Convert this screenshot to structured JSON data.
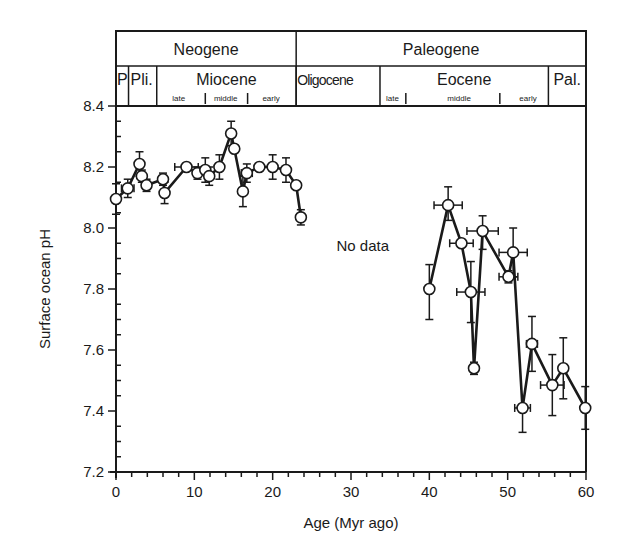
{
  "chart_data": {
    "type": "line",
    "title": "",
    "xlabel": "Age (Myr ago)",
    "ylabel": "Surface ocean pH",
    "xlim": [
      0,
      60
    ],
    "ylim": [
      7.2,
      8.4
    ],
    "x_ticks": [
      0,
      10,
      20,
      30,
      40,
      50,
      60
    ],
    "x_tick_labels": [
      "0",
      "10",
      "20",
      "30",
      "40",
      "50",
      "60"
    ],
    "y_ticks": [
      7.2,
      7.4,
      7.6,
      7.8,
      8.0,
      8.2,
      8.4
    ],
    "y_tick_labels": [
      "7.2",
      "7.4",
      "7.6",
      "7.8",
      "8.0",
      "8.2",
      "8.4"
    ],
    "grid": false,
    "legend": null,
    "annotations": [
      {
        "text": "No data",
        "x": 31.5,
        "y": 7.94
      }
    ],
    "marker": "open-circle",
    "series": [
      {
        "name": "Neogene segment",
        "points": [
          {
            "x": 0.0,
            "y": 8.095,
            "yerr": [
              0.05,
              0.05
            ],
            "xerr": 0
          },
          {
            "x": 1.5,
            "y": 8.13,
            "yerr": [
              0.03,
              0.03
            ],
            "xerr": 0.8
          },
          {
            "x": 3.0,
            "y": 8.21,
            "yerr": [
              0.04,
              0.04
            ],
            "xerr": 0
          },
          {
            "x": 3.3,
            "y": 8.17,
            "yerr": [
              0.02,
              0.02
            ],
            "xerr": 0
          },
          {
            "x": 3.9,
            "y": 8.14,
            "yerr": [
              0.02,
              0.02
            ],
            "xerr": 0
          },
          {
            "x": 6.0,
            "y": 8.16,
            "yerr": [
              0.02,
              0.02
            ],
            "xerr": 0
          },
          {
            "x": 6.2,
            "y": 8.115,
            "yerr": [
              0.035,
              0.035
            ],
            "xerr": 0
          },
          {
            "x": 9.0,
            "y": 8.2,
            "yerr": [
              0.0,
              0.0
            ],
            "xerr": 1.5
          },
          {
            "x": 10.4,
            "y": 8.18,
            "yerr": [
              0.02,
              0.02
            ],
            "xerr": 0
          },
          {
            "x": 11.4,
            "y": 8.19,
            "yerr": [
              0.04,
              0.04
            ],
            "xerr": 0
          },
          {
            "x": 11.9,
            "y": 8.17,
            "yerr": [
              0.03,
              0.03
            ],
            "xerr": 0
          },
          {
            "x": 13.2,
            "y": 8.2,
            "yerr": [
              0.04,
              0.04
            ],
            "xerr": 0
          },
          {
            "x": 14.7,
            "y": 8.31,
            "yerr": [
              0.04,
              0.04
            ],
            "xerr": 0
          },
          {
            "x": 15.1,
            "y": 8.26,
            "yerr": [
              0.0,
              0.0
            ],
            "xerr": 0
          },
          {
            "x": 16.2,
            "y": 8.12,
            "yerr": [
              0.05,
              0.05
            ],
            "xerr": 0
          },
          {
            "x": 16.7,
            "y": 8.18,
            "yerr": [
              0.03,
              0.03
            ],
            "xerr": 0.7
          },
          {
            "x": 18.3,
            "y": 8.2,
            "yerr": [
              0.0,
              0.0
            ],
            "xerr": 0
          },
          {
            "x": 20.0,
            "y": 8.2,
            "yerr": [
              0.04,
              0.04
            ],
            "xerr": 0
          },
          {
            "x": 21.7,
            "y": 8.19,
            "yerr": [
              0.04,
              0.04
            ],
            "xerr": 0
          },
          {
            "x": 23.0,
            "y": 8.14,
            "yerr": [
              0.0,
              0.0
            ],
            "xerr": 0
          },
          {
            "x": 23.6,
            "y": 8.035,
            "yerr": [
              0.025,
              0.025
            ],
            "xerr": 0
          }
        ]
      },
      {
        "name": "Paleogene segment",
        "points": [
          {
            "x": 40.0,
            "y": 7.8,
            "yerr": [
              0.1,
              0.08
            ],
            "xerr": 0
          },
          {
            "x": 42.4,
            "y": 8.075,
            "yerr": [
              0.05,
              0.06
            ],
            "xerr": 1.8
          },
          {
            "x": 44.1,
            "y": 7.95,
            "yerr": [
              0.0,
              0.0
            ],
            "xerr": 1.5
          },
          {
            "x": 45.3,
            "y": 7.79,
            "yerr": [
              0.1,
              0.1
            ],
            "xerr": 1.8
          },
          {
            "x": 45.7,
            "y": 7.54,
            "yerr": [
              0.02,
              0.02
            ],
            "xerr": 0
          },
          {
            "x": 46.8,
            "y": 7.99,
            "yerr": [
              0.06,
              0.05
            ],
            "xerr": 2.0
          },
          {
            "x": 50.1,
            "y": 7.84,
            "yerr": [
              0.02,
              0.02
            ],
            "xerr": 1.2
          },
          {
            "x": 50.7,
            "y": 7.92,
            "yerr": [
              0.08,
              0.08
            ],
            "xerr": 1.8
          },
          {
            "x": 51.9,
            "y": 7.41,
            "yerr": [
              0.08,
              0.0
            ],
            "xerr": 1.0
          },
          {
            "x": 53.1,
            "y": 7.62,
            "yerr": [
              0.09,
              0.09
            ],
            "xerr": 0.7
          },
          {
            "x": 55.7,
            "y": 7.485,
            "yerr": [
              0.1,
              0.1
            ],
            "xerr": 1.5
          },
          {
            "x": 57.1,
            "y": 7.54,
            "yerr": [
              0.1,
              0.1
            ],
            "xerr": 0
          },
          {
            "x": 59.9,
            "y": 7.41,
            "yerr": [
              0.07,
              0.07
            ],
            "xerr": 0
          }
        ]
      }
    ],
    "timescale": {
      "periods": [
        {
          "label": "Neogene",
          "start": 0,
          "end": 23.0
        },
        {
          "label": "Paleogene",
          "start": 23.0,
          "end": 60
        }
      ],
      "epochs": [
        {
          "label": "P",
          "start": 0,
          "end": 1.6
        },
        {
          "label": "Pli.",
          "start": 1.6,
          "end": 5.2
        },
        {
          "label": "Miocene",
          "start": 5.2,
          "end": 23.0,
          "sub": [
            {
              "label": "late",
              "at": 8.0
            },
            {
              "label": "middle",
              "at": 14.0
            },
            {
              "label": "early",
              "at": 19.8
            }
          ],
          "sub_ticks": [
            11.4,
            16.8
          ]
        },
        {
          "label": "Oligocene",
          "start": 23.0,
          "end": 33.7
        },
        {
          "label": "Eocene",
          "start": 33.7,
          "end": 55.2,
          "sub": [
            {
              "label": "late",
              "at": 35.3
            },
            {
              "label": "middle",
              "at": 43.8
            },
            {
              "label": "early",
              "at": 52.6
            }
          ],
          "sub_ticks": [
            37.0,
            49.0
          ]
        },
        {
          "label": "Pal.",
          "start": 55.2,
          "end": 60
        }
      ]
    }
  }
}
